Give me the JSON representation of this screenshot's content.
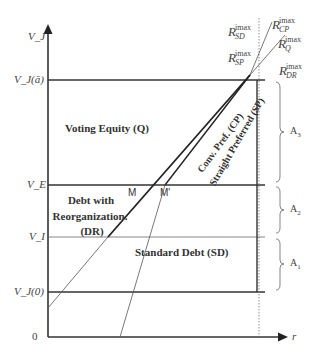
{
  "diagram": {
    "axes": {
      "y_label": "V_J",
      "x_label": "r",
      "origin_label": "0"
    },
    "y_ticks": [
      {
        "id": "vj_abar",
        "label": "V_J(ā)",
        "y": 80
      },
      {
        "id": "ve",
        "label": "V_E",
        "y": 185
      },
      {
        "id": "vi",
        "label": "V_I",
        "y": 237
      },
      {
        "id": "vj0",
        "label": "V_J(0)",
        "y": 292
      }
    ],
    "regions": {
      "voting_equity": "Voting Equity (Q)",
      "debt_reorg_line1": "Debt with",
      "debt_reorg_line2": "Reorganization.",
      "debt_reorg_line3": "(DR)",
      "standard_debt": "Standard Debt (SD)",
      "conv_pref": "Conv. Pref. (CP)",
      "straight_pref": "Straight Preferred (SP)"
    },
    "points": {
      "m": "M",
      "m_prime": "M'"
    },
    "rmax_labels": [
      {
        "id": "sd",
        "base": "R",
        "sup": "imax",
        "sub": "SD"
      },
      {
        "id": "cp",
        "base": "R",
        "sup": "imax",
        "sub": "CP"
      },
      {
        "id": "q",
        "base": "R",
        "sup": "imax",
        "sub": "Q"
      },
      {
        "id": "sp",
        "base": "R",
        "sup": "imax",
        "sub": "SP"
      },
      {
        "id": "dr",
        "base": "R",
        "sup": "imax",
        "sub": "DR"
      }
    ],
    "brackets": [
      {
        "label": "A",
        "sub": "3"
      },
      {
        "label": "A",
        "sub": "2"
      },
      {
        "label": "A",
        "sub": "1"
      }
    ]
  }
}
